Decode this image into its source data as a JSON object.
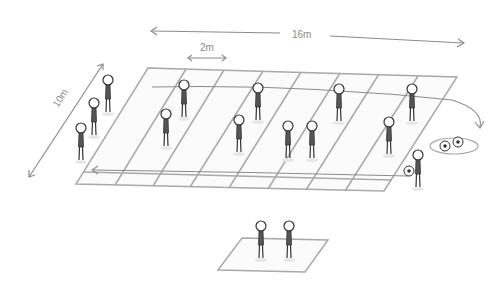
{
  "diagram": {
    "dimensions": {
      "length_label": "16m",
      "width_label": "10m",
      "lane_label": "2m"
    },
    "colors": {
      "lines": "#a9a9a9",
      "arrows": "#8c8c8c",
      "figure": "#333333",
      "shirt": "#555555"
    },
    "grid": {
      "lanes": 8,
      "corners": {
        "top_left": [
          148,
          68
        ],
        "top_right": [
          457,
          77
        ],
        "bottom_right": [
          384,
          191
        ],
        "bottom_left": [
          76,
          184
        ]
      }
    },
    "players_left_queue": 3,
    "players_in_grid": 10,
    "balls_in_circle": 2,
    "ball_carrier": 1,
    "players_in_small_square": 2
  }
}
